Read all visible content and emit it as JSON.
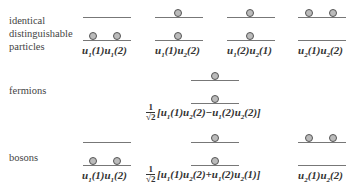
{
  "rows": {
    "distinguishable": {
      "label": "identical\ndistinguishable\nparticles",
      "label_lines": [
        "identical",
        "distinguishable",
        "particles"
      ],
      "states": [
        {
          "upper_particles": 0,
          "lower_particles": 2,
          "formula": "u1(1)u1(2)"
        },
        {
          "upper_particles": 1,
          "lower_particles": 1,
          "formula": "u1(1)u2(2)"
        },
        {
          "upper_particles": 1,
          "lower_particles": 1,
          "formula": "u1(2)u2(1)"
        },
        {
          "upper_particles": 2,
          "lower_particles": 0,
          "formula": "u2(1)u2(2)"
        }
      ]
    },
    "fermions": {
      "label": "fermions",
      "states": [
        {
          "upper_particles": 1,
          "lower_particles": 1,
          "prefactor": "1/√2",
          "formula": "[u1(1)u2(2)−u1(2)u2(2)]"
        }
      ]
    },
    "bosons": {
      "label": "bosons",
      "states": [
        {
          "upper_particles": 0,
          "lower_particles": 2,
          "formula": "u1(1)u1(2)"
        },
        {
          "upper_particles": 1,
          "lower_particles": 1,
          "prefactor": "1/√2",
          "formula": "[u1(1)u2(2)+u1(2)u2(1)]"
        },
        {
          "upper_particles": 2,
          "lower_particles": 0,
          "formula": "u2(1)u2(2)"
        }
      ]
    }
  },
  "text": {
    "label_identical": "identical",
    "label_distinguishable": "distinguishable",
    "label_particles": "particles",
    "label_fermions": "fermions",
    "label_bosons": "bosons",
    "frac_num": "1",
    "frac_den": "√2"
  }
}
